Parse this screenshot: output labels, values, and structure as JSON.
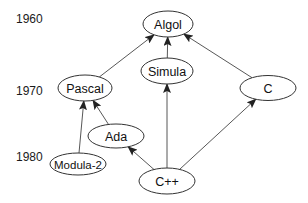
{
  "diagram": {
    "years": [
      {
        "label": "1960",
        "x": 16,
        "y": 23
      },
      {
        "label": "1970",
        "x": 16,
        "y": 95
      },
      {
        "label": "1980",
        "x": 16,
        "y": 161
      }
    ],
    "nodes": [
      {
        "id": "algol",
        "label": "Algol",
        "cx": 168,
        "cy": 24,
        "rx": 25,
        "ry": 13
      },
      {
        "id": "simula",
        "label": "Simula",
        "cx": 167,
        "cy": 71,
        "rx": 26,
        "ry": 13
      },
      {
        "id": "pascal",
        "label": "Pascal",
        "cx": 85,
        "cy": 88,
        "rx": 27,
        "ry": 13
      },
      {
        "id": "c",
        "label": "C",
        "cx": 268,
        "cy": 88,
        "rx": 28,
        "ry": 12.5
      },
      {
        "id": "ada",
        "label": "Ada",
        "cx": 116,
        "cy": 136,
        "rx": 28,
        "ry": 12
      },
      {
        "id": "modula2",
        "label": "Modula-2",
        "cx": 78,
        "cy": 164,
        "rx": 28,
        "ry": 11
      },
      {
        "id": "cpp",
        "label": "C++",
        "cx": 167,
        "cy": 181,
        "rx": 28,
        "ry": 13
      }
    ],
    "edges": [
      {
        "from": "simula",
        "to": "algol"
      },
      {
        "from": "pascal",
        "to": "algol"
      },
      {
        "from": "c",
        "to": "algol"
      },
      {
        "from": "modula2",
        "to": "pascal"
      },
      {
        "from": "ada",
        "to": "pascal"
      },
      {
        "from": "cpp",
        "to": "ada"
      },
      {
        "from": "cpp",
        "to": "simula"
      },
      {
        "from": "cpp",
        "to": "c"
      }
    ],
    "colors": {
      "stroke": "#333333",
      "arrow": "#222222",
      "background": "#ffffff"
    }
  }
}
